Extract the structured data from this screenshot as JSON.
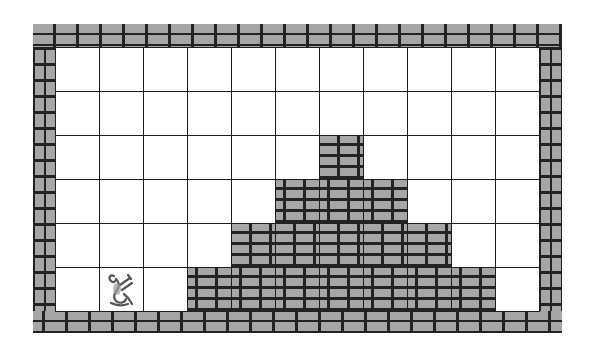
{
  "game": {
    "type": "grid-puzzle",
    "grid": {
      "columns": 11,
      "rows": 6,
      "cell_size_px": 44,
      "column_heights": [
        0,
        0,
        0,
        1,
        2,
        3,
        4,
        3,
        2,
        1,
        0
      ],
      "cells": [
        [
          0,
          0,
          0,
          0,
          0,
          0,
          0,
          0,
          0,
          0,
          0
        ],
        [
          0,
          0,
          0,
          0,
          0,
          0,
          0,
          0,
          0,
          0,
          0
        ],
        [
          0,
          0,
          0,
          0,
          0,
          0,
          1,
          0,
          0,
          0,
          0
        ],
        [
          0,
          0,
          0,
          0,
          0,
          1,
          1,
          1,
          0,
          0,
          0
        ],
        [
          0,
          0,
          0,
          0,
          1,
          1,
          1,
          1,
          1,
          0,
          0
        ],
        [
          0,
          0,
          0,
          1,
          1,
          1,
          1,
          1,
          1,
          1,
          0
        ]
      ]
    },
    "player": {
      "icon": "lizard-icon",
      "row": 5,
      "col": 1
    },
    "colors": {
      "brick": "#a6a6a6",
      "mortar": "#232323",
      "empty": "#ffffff",
      "grid_line": "#1f1f1f"
    }
  }
}
